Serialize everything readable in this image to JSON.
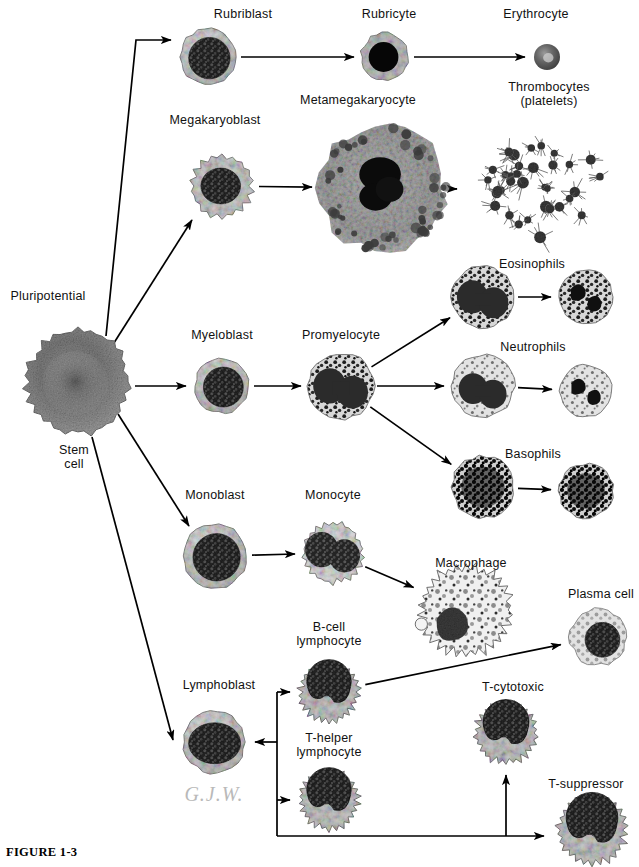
{
  "figure": {
    "number": "FIGURE 1-3",
    "caption": "",
    "signature": "G.J.W.",
    "width": 639,
    "height": 867,
    "background": "#ffffff",
    "ink_color": "#000000"
  },
  "labels": [
    {
      "id": "pluripotential-stem-cell",
      "text": "Pluripotential",
      "x": 48,
      "y": 289
    },
    {
      "id": "stem-cell-line2",
      "text": "Stem\ncell",
      "x": 74,
      "y": 443
    },
    {
      "id": "rubriblast",
      "text": "Rubriblast",
      "x": 243,
      "y": 7
    },
    {
      "id": "rubricyte",
      "text": "Rubricyte",
      "x": 389,
      "y": 7
    },
    {
      "id": "erythrocyte",
      "text": "Erythrocyte",
      "x": 536,
      "y": 7
    },
    {
      "id": "thrombocytes",
      "text": "Thrombocytes\n(platelets)",
      "x": 549,
      "y": 80
    },
    {
      "id": "megakaryoblast",
      "text": "Megakaryoblast",
      "x": 215,
      "y": 113
    },
    {
      "id": "metamegakaryocyte",
      "text": "Metamegakaryocyte",
      "x": 358,
      "y": 93
    },
    {
      "id": "myeloblast",
      "text": "Myeloblast",
      "x": 222,
      "y": 328
    },
    {
      "id": "promyelocyte",
      "text": "Promyelocyte",
      "x": 341,
      "y": 328
    },
    {
      "id": "eosinophils",
      "text": "Eosinophils",
      "x": 532,
      "y": 257
    },
    {
      "id": "neutrophils",
      "text": "Neutrophils",
      "x": 533,
      "y": 340
    },
    {
      "id": "basophils",
      "text": "Basophils",
      "x": 533,
      "y": 447
    },
    {
      "id": "monoblast",
      "text": "Monoblast",
      "x": 215,
      "y": 488
    },
    {
      "id": "monocyte",
      "text": "Monocyte",
      "x": 333,
      "y": 488
    },
    {
      "id": "macrophage",
      "text": "Macrophage",
      "x": 471,
      "y": 556
    },
    {
      "id": "plasma-cell",
      "text": "Plasma cell",
      "x": 601,
      "y": 587
    },
    {
      "id": "b-cell-lymphocyte",
      "text": "B-cell\nlymphocyte",
      "x": 329,
      "y": 620
    },
    {
      "id": "lymphoblast",
      "text": "Lymphoblast",
      "x": 219,
      "y": 678
    },
    {
      "id": "t-helper-lymphocyte",
      "text": "T-helper\nlymphocyte",
      "x": 329,
      "y": 731
    },
    {
      "id": "t-cytotoxic",
      "text": "T-cytotoxic",
      "x": 513,
      "y": 680
    },
    {
      "id": "t-suppressor",
      "text": "T-suppressor",
      "x": 586,
      "y": 777
    }
  ],
  "cells": [
    {
      "id": "stem-cell",
      "name": "pluripotential-stem-cell",
      "cx": 78,
      "cy": 382,
      "r": 53,
      "style": "stem"
    },
    {
      "id": "rubriblast",
      "name": "rubriblast",
      "cx": 208,
      "cy": 57,
      "r": 28,
      "style": "blast"
    },
    {
      "id": "rubricyte",
      "name": "rubricyte",
      "cx": 385,
      "cy": 57,
      "r": 24,
      "style": "rubricyte"
    },
    {
      "id": "erythrocyte",
      "name": "erythrocyte",
      "cx": 547,
      "cy": 57,
      "r": 13,
      "style": "erythrocyte"
    },
    {
      "id": "megakaryoblast",
      "name": "megakaryoblast",
      "cx": 222,
      "cy": 186,
      "r": 32,
      "style": "megakaryoblast"
    },
    {
      "id": "metamegakaryocyte",
      "name": "metamegakaryocyte",
      "cx": 382,
      "cy": 188,
      "r": 63,
      "style": "megakaryocyte"
    },
    {
      "id": "platelet-cluster",
      "name": "thrombocyte-cluster",
      "cx": 545,
      "cy": 190,
      "r": 58,
      "style": "platelets"
    },
    {
      "id": "myeloblast",
      "name": "myeloblast",
      "cx": 222,
      "cy": 386,
      "r": 27,
      "style": "blast"
    },
    {
      "id": "promyelocyte",
      "name": "promyelocyte",
      "cx": 341,
      "cy": 386,
      "r": 33,
      "style": "granular"
    },
    {
      "id": "eosinophil-band",
      "name": "eosinophil-immature",
      "cx": 483,
      "cy": 297,
      "r": 31,
      "style": "granular"
    },
    {
      "id": "eosinophil-mature",
      "name": "eosinophil-mature",
      "cx": 586,
      "cy": 297,
      "r": 27,
      "style": "segmented"
    },
    {
      "id": "neutrophil-band",
      "name": "neutrophil-immature",
      "cx": 483,
      "cy": 386,
      "r": 31,
      "style": "granular-light"
    },
    {
      "id": "neutrophil-mature",
      "name": "neutrophil-mature",
      "cx": 586,
      "cy": 391,
      "r": 26,
      "style": "segmented-light"
    },
    {
      "id": "basophil-band",
      "name": "basophil-immature",
      "cx": 483,
      "cy": 487,
      "r": 31,
      "style": "dark-granular"
    },
    {
      "id": "basophil-mature",
      "name": "basophil-mature",
      "cx": 586,
      "cy": 491,
      "r": 27,
      "style": "dark-granular"
    },
    {
      "id": "monoblast",
      "name": "monoblast",
      "cx": 215,
      "cy": 556,
      "r": 32,
      "style": "blast"
    },
    {
      "id": "monocyte",
      "name": "monocyte",
      "cx": 333,
      "cy": 553,
      "r": 31,
      "style": "monocyte"
    },
    {
      "id": "macrophage",
      "name": "macrophage",
      "cx": 466,
      "cy": 610,
      "r": 47,
      "style": "macrophage"
    },
    {
      "id": "plasma-cell",
      "name": "plasma-cell",
      "cx": 598,
      "cy": 637,
      "r": 28,
      "style": "plasma"
    },
    {
      "id": "b-cell",
      "name": "b-cell-lymphocyte",
      "cx": 329,
      "cy": 692,
      "r": 31,
      "style": "lymphocyte"
    },
    {
      "id": "lymphoblast",
      "name": "lymphoblast",
      "cx": 214,
      "cy": 742,
      "r": 31,
      "style": "lymphoblast"
    },
    {
      "id": "t-helper",
      "name": "t-helper-lymphocyte",
      "cx": 329,
      "cy": 800,
      "r": 31,
      "style": "lymphocyte"
    },
    {
      "id": "t-cytotoxic",
      "name": "t-cytotoxic",
      "cx": 506,
      "cy": 733,
      "r": 32,
      "style": "lymphocyte"
    },
    {
      "id": "t-suppressor",
      "name": "t-suppressor",
      "cx": 592,
      "cy": 830,
      "r": 36,
      "style": "lymphocyte"
    }
  ],
  "arrows": [
    {
      "id": "stem-to-rubriblast",
      "from": "stem-cell",
      "to": "rubriblast",
      "kind": "elbow-up"
    },
    {
      "id": "rubriblast-to-rubricyte",
      "from": "rubriblast",
      "to": "rubricyte",
      "kind": "straight"
    },
    {
      "id": "rubricyte-to-erythrocyte",
      "from": "rubricyte",
      "to": "erythrocyte",
      "kind": "straight"
    },
    {
      "id": "stem-to-megakaryoblast",
      "from": "stem-cell",
      "to": "megakaryoblast",
      "kind": "diagonal"
    },
    {
      "id": "megakaryoblast-to-meta",
      "from": "megakaryoblast",
      "to": "metamegakaryocyte",
      "kind": "straight"
    },
    {
      "id": "meta-to-platelets",
      "from": "metamegakaryocyte",
      "to": "platelet-cluster",
      "kind": "straight"
    },
    {
      "id": "stem-to-myeloblast",
      "from": "stem-cell",
      "to": "myeloblast",
      "kind": "straight"
    },
    {
      "id": "myeloblast-to-promyelocyte",
      "from": "myeloblast",
      "to": "promyelocyte",
      "kind": "straight"
    },
    {
      "id": "promyelocyte-to-eosinophil",
      "from": "promyelocyte",
      "to": "eosinophil-band",
      "kind": "diagonal"
    },
    {
      "id": "promyelocyte-to-neutrophil",
      "from": "promyelocyte",
      "to": "neutrophil-band",
      "kind": "straight"
    },
    {
      "id": "promyelocyte-to-basophil",
      "from": "promyelocyte",
      "to": "basophil-band",
      "kind": "diagonal"
    },
    {
      "id": "eosinophil-maturation",
      "from": "eosinophil-band",
      "to": "eosinophil-mature",
      "kind": "straight"
    },
    {
      "id": "neutrophil-maturation",
      "from": "neutrophil-band",
      "to": "neutrophil-mature",
      "kind": "straight"
    },
    {
      "id": "basophil-maturation",
      "from": "basophil-band",
      "to": "basophil-mature",
      "kind": "straight"
    },
    {
      "id": "stem-to-monoblast",
      "from": "stem-cell",
      "to": "monoblast",
      "kind": "diagonal"
    },
    {
      "id": "monoblast-to-monocyte",
      "from": "monoblast",
      "to": "monocyte",
      "kind": "straight"
    },
    {
      "id": "monocyte-to-macrophage",
      "from": "monocyte",
      "to": "macrophage",
      "kind": "diagonal"
    },
    {
      "id": "stem-to-lymphoblast",
      "from": "stem-cell",
      "to": "lymphoblast",
      "kind": "diagonal"
    },
    {
      "id": "lymphoblast-bracket",
      "from": "lymphoblast",
      "to": "lymphoid-bracket",
      "kind": "bracket"
    },
    {
      "id": "bracket-to-bcell",
      "from": "lymphoid-bracket",
      "to": "b-cell",
      "kind": "bracket-stub"
    },
    {
      "id": "bracket-to-thelper",
      "from": "lymphoid-bracket",
      "to": "t-helper",
      "kind": "bracket-stub"
    },
    {
      "id": "bcell-to-plasma",
      "from": "b-cell",
      "to": "plasma-cell",
      "kind": "diagonal"
    },
    {
      "id": "rail-to-tcytotoxic",
      "from": "lymphoid-bracket",
      "to": "t-cytotoxic",
      "kind": "rail-up"
    },
    {
      "id": "rail-to-tsuppressor",
      "from": "lymphoid-bracket",
      "to": "t-suppressor",
      "kind": "rail-right"
    }
  ]
}
